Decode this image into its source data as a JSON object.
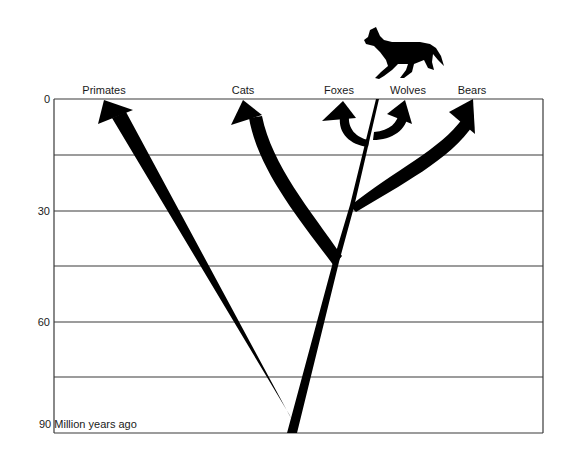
{
  "diagram": {
    "type": "phylogenetic-tree",
    "axis": {
      "unit_label": "Million years ago",
      "ticks": [
        {
          "value": "0",
          "y": 99
        },
        {
          "value": "30",
          "y": 211
        },
        {
          "value": "60",
          "y": 322
        },
        {
          "value": "90",
          "y": 433
        }
      ],
      "bottom_label": "90 Million years ago",
      "gridlines_y": [
        99,
        155,
        211,
        266,
        322,
        377,
        433
      ]
    },
    "taxa": [
      {
        "name": "Primates",
        "x": 104
      },
      {
        "name": "Cats",
        "x": 243
      },
      {
        "name": "Foxes",
        "x": 339
      },
      {
        "name": "Wolves",
        "x": 408
      },
      {
        "name": "Bears",
        "x": 472
      }
    ],
    "branch_points": [
      {
        "between": [
          "Primates",
          "Carnivores"
        ],
        "mya": 85
      },
      {
        "between": [
          "Cats",
          "Caniforms"
        ],
        "mya": 44
      },
      {
        "between": [
          "Bears",
          "Canids"
        ],
        "mya": 29
      },
      {
        "between": [
          "Foxes",
          "Wolves"
        ],
        "mya": 5
      }
    ],
    "illustration": "wolf silhouette above Wolves label",
    "colors": {
      "ink": "#000000",
      "grid": "#3a3a3a",
      "background": "#ffffff"
    }
  }
}
